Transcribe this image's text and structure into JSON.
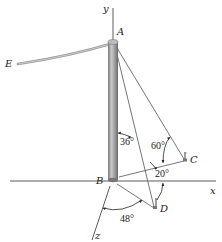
{
  "figure": {
    "points": {
      "A": "A",
      "B": "B",
      "C": "C",
      "D": "D",
      "E": "E"
    },
    "axes": {
      "x": "x",
      "y": "y",
      "z": "z"
    },
    "angles": {
      "pole_cable_AD": "36°",
      "cable_AC_elevation": "60°",
      "BC_from_x": "20°",
      "BD_from_z": "48°"
    },
    "colors": {
      "pole": "#8a8a8a",
      "pole_highlight": "#c8c8c8",
      "cable": "#6e6e6e",
      "axis": "#333333",
      "wire_E": "#9a9a9a"
    }
  }
}
